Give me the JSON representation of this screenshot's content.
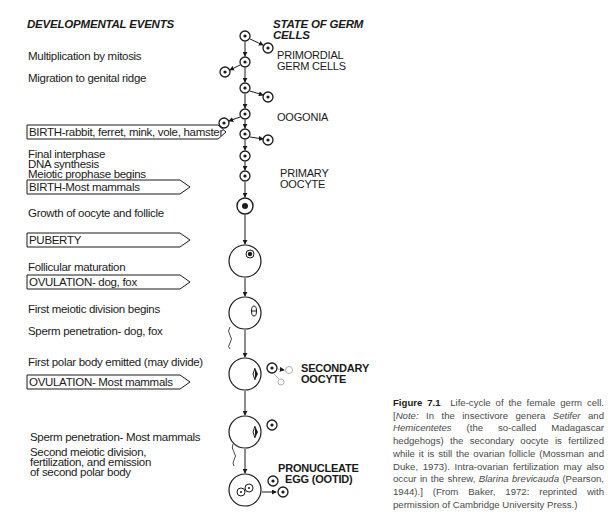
{
  "headers": {
    "left": "DEVELOPMENTAL EVENTS",
    "right_line1": "STATE OF GERM",
    "right_line2": "CELLS"
  },
  "events": [
    {
      "text": "Multiplication by mitosis"
    },
    {
      "text": "Migration to genital ridge"
    },
    {
      "text": "Final interphase"
    },
    {
      "text": "DNA synthesis"
    },
    {
      "text": "Meiotic prophase begins"
    },
    {
      "text": "Growth of oocyte and follicle"
    },
    {
      "text": "Follicular maturation"
    },
    {
      "text": "First meiotic division begins"
    },
    {
      "text": "Sperm penetration- dog, fox"
    },
    {
      "text": "First polar body emitted (may divide)"
    },
    {
      "text": "Sperm penetration-  Most  mammals"
    },
    {
      "text": "Second meiotic division,"
    },
    {
      "text": "fertilization, and emission"
    },
    {
      "text": "of second polar body"
    }
  ],
  "milestones": [
    {
      "text": "BIRTH-rabbit, ferret, mink, vole, hamster"
    },
    {
      "text": "BIRTH-Most mammals"
    },
    {
      "text": "PUBERTY"
    },
    {
      "text": "OVULATION- dog, fox"
    },
    {
      "text": "OVULATION- Most mammals"
    }
  ],
  "stages": [
    {
      "line1": "PRIMORDIAL",
      "line2": "GERM CELLS"
    },
    {
      "line1": "OOGONIA",
      "line2": ""
    },
    {
      "line1": "PRIMARY",
      "line2": "OOCYTE"
    },
    {
      "line1": "SECONDARY",
      "line2": "OOCYTE"
    },
    {
      "line1": "PRONUCLEATE",
      "line2": "EGG (OOTID)"
    }
  ],
  "caption": {
    "label": "Figure 7.1",
    "title": "Life-cycle of the female germ cell.",
    "note_open": "[",
    "note_label": "Note:",
    "text_a": " In the insectivore genera ",
    "genus1": "Setifer",
    "text_b": " and ",
    "genus2": "Hemicentetes",
    "text_c": " (the so-called Madagascar hedgehogs) the secondary oocyte is fertilized while it is still the ovarian follicle (Mossman and Duke, 1973). Intra-ovarian fertilization may also occur in the shrew, ",
    "species": "Blarina brevicauda",
    "text_d": " (Pearson, 1944).] (From Baker, 1972: reprinted with permission of Cambridge University Press.)"
  },
  "colors": {
    "ink": "#1a1a1a",
    "caption_text": "#4a4a4a",
    "faint_polar_body": "#b0b0b0"
  }
}
